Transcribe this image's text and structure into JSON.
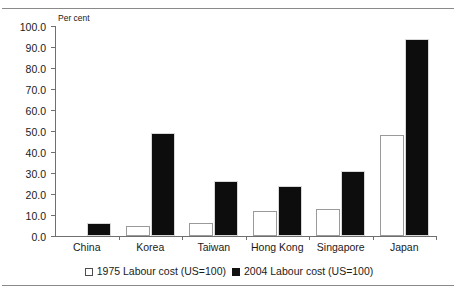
{
  "figure": {
    "title": "",
    "axis_unit_label": "Per cent"
  },
  "chart_data": {
    "type": "bar",
    "title": "",
    "xlabel": "",
    "ylabel": "Per cent",
    "ylim": [
      0,
      100
    ],
    "yticks": [
      "0.0",
      "10.0",
      "20.0",
      "30.0",
      "40.0",
      "50.0",
      "60.0",
      "70.0",
      "80.0",
      "90.0",
      "100.0"
    ],
    "ytick_values": [
      0,
      10,
      20,
      30,
      40,
      50,
      60,
      70,
      80,
      90,
      100
    ],
    "grid": false,
    "legend_position": "bottom",
    "categories": [
      "China",
      "Korea",
      "Taiwan",
      "Hong Kong",
      "Singapore",
      "Japan"
    ],
    "series": [
      {
        "name": "1975 Labour cost (US=100)",
        "color": "#ffffff",
        "style": "open",
        "values": [
          0,
          5,
          6,
          12,
          13,
          48
        ]
      },
      {
        "name": "2004 Labour cost (US=100)",
        "color": "#111111",
        "style": "filled",
        "values": [
          6,
          49,
          26,
          24,
          31,
          94
        ]
      }
    ]
  },
  "legend": {
    "entries": [
      {
        "label": "1975 Labour cost (US=100)",
        "swatch": "open-square-icon"
      },
      {
        "label": "2004 Labour cost (US=100)",
        "swatch": "filled-square-icon"
      }
    ]
  }
}
